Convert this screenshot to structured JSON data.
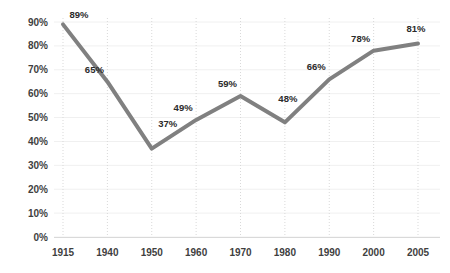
{
  "chart_data": {
    "type": "line",
    "title": "",
    "subtitle": "",
    "xlabel": "",
    "ylabel": "",
    "categories": [
      "1915",
      "1940",
      "1950",
      "1960",
      "1970",
      "1980",
      "1990",
      "2000",
      "2005"
    ],
    "values": [
      89,
      65,
      37,
      49,
      59,
      48,
      66,
      78,
      81
    ],
    "point_labels": [
      "89%",
      "65%",
      "37%",
      "49%",
      "59%",
      "48%",
      "66%",
      "78%",
      "81%"
    ],
    "ytick_labels": [
      "0%",
      "10%",
      "20%",
      "30%",
      "40%",
      "50%",
      "60%",
      "70%",
      "80%",
      "90%"
    ],
    "ytick_values": [
      0,
      10,
      20,
      30,
      40,
      50,
      60,
      70,
      80,
      90
    ],
    "ylim": [
      0,
      90
    ],
    "xtick_labels": [
      "1915",
      "1940",
      "1950",
      "1960",
      "1970",
      "1980",
      "1990",
      "2000",
      "2005"
    ],
    "grid": {
      "horizontal": true,
      "vertical": true,
      "horizontal_style": "solid",
      "vertical_style": "dotted"
    },
    "legend": {
      "visible": false,
      "position": "none",
      "entries": []
    },
    "series": [
      {
        "name": "",
        "values": [
          89,
          65,
          37,
          49,
          59,
          48,
          66,
          78,
          81
        ]
      }
    ],
    "colors": {
      "line": "#808080",
      "background": "#ffffff",
      "axis": "#d9d9d9",
      "grid_horizontal": "#f0f0f0",
      "grid_vertical": "#d9d9d9",
      "tick_text": "#3f3f3f",
      "data_label_text": "#2b2b2b"
    },
    "line_width": 4,
    "markers": false
  }
}
